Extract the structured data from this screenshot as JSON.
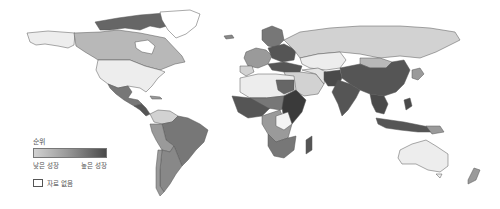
{
  "map": {
    "type": "choropleth world map",
    "projection": "equirectangular-like",
    "colors": {
      "no_data": "#ffffff",
      "very_low": "#ededed",
      "low": "#d2d2d2",
      "mid_low": "#b8b8b8",
      "mid": "#9a9a9a",
      "mid_high": "#777777",
      "high": "#555555",
      "very_high": "#3a3a3a",
      "border": "#555555"
    },
    "regions": [
      {
        "name": "Canada",
        "tone": "mid"
      },
      {
        "name": "Canadian Arctic Islands",
        "tone": "high"
      },
      {
        "name": "Alaska",
        "tone": "very_low"
      },
      {
        "name": "Greenland",
        "tone": "no_data"
      },
      {
        "name": "United States",
        "tone": "very_low"
      },
      {
        "name": "Mexico",
        "tone": "mid_high"
      },
      {
        "name": "Central America",
        "tone": "high"
      },
      {
        "name": "Colombia/Venezuela",
        "tone": "low"
      },
      {
        "name": "Brazil",
        "tone": "mid_high"
      },
      {
        "name": "Peru/Bolivia",
        "tone": "mid"
      },
      {
        "name": "Argentina",
        "tone": "mid_high"
      },
      {
        "name": "Chile",
        "tone": "mid"
      },
      {
        "name": "Russia",
        "tone": "low"
      },
      {
        "name": "Kazakhstan",
        "tone": "very_low"
      },
      {
        "name": "China",
        "tone": "high"
      },
      {
        "name": "India",
        "tone": "high"
      },
      {
        "name": "Pakistan/Afghanistan",
        "tone": "high"
      },
      {
        "name": "Middle East",
        "tone": "low"
      },
      {
        "name": "Europe",
        "tone": "mid"
      },
      {
        "name": "Scandinavia",
        "tone": "mid_high"
      },
      {
        "name": "North Africa",
        "tone": "very_low"
      },
      {
        "name": "West Africa",
        "tone": "high"
      },
      {
        "name": "Central Africa",
        "tone": "mid"
      },
      {
        "name": "East Africa",
        "tone": "very_high"
      },
      {
        "name": "Southern Africa",
        "tone": "mid_high"
      },
      {
        "name": "Madagascar",
        "tone": "high"
      },
      {
        "name": "Southeast Asia",
        "tone": "high"
      },
      {
        "name": "Indonesia",
        "tone": "high"
      },
      {
        "name": "Australia",
        "tone": "very_low"
      },
      {
        "name": "New Zealand",
        "tone": "mid"
      },
      {
        "name": "Japan",
        "tone": "mid"
      }
    ]
  },
  "legend": {
    "title": "순위",
    "low_label": "낮은 성장",
    "high_label": "높은 성장",
    "no_data_label": "자료 없음",
    "gradient_start": "#d2d2d2",
    "gradient_end": "#4a4a4a"
  }
}
